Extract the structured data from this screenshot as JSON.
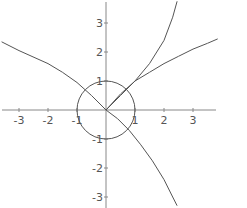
{
  "chart_data": {
    "type": "line",
    "title": "",
    "xlabel": "",
    "ylabel": "",
    "xlim": [
      -3.6,
      3.85
    ],
    "ylim": [
      -3.3,
      3.75
    ],
    "grid": false,
    "legend": null,
    "x_ticks": [
      -3,
      -2,
      -1,
      1,
      2,
      3
    ],
    "y_ticks": [
      -3,
      -2,
      -1,
      1,
      2,
      3
    ],
    "x_tick_labels": [
      "-3",
      "-2",
      "-1",
      "1",
      "2",
      "3"
    ],
    "y_tick_labels": [
      "-3",
      "-2",
      "-1",
      "1",
      "2",
      "3"
    ],
    "series": [
      {
        "name": "unit-circle",
        "shape": "circle",
        "center": [
          0,
          0
        ],
        "radius": 1
      },
      {
        "name": "curve-through-origin",
        "points": [
          [
            -3.6,
            2.35
          ],
          [
            -3,
            2.05
          ],
          [
            -2,
            1.6
          ],
          [
            -1.5,
            1.3
          ],
          [
            -1,
            0.95
          ],
          [
            -0.5,
            0.5
          ],
          [
            0,
            0
          ],
          [
            0.4,
            -0.3
          ],
          [
            0.8,
            -0.7
          ],
          [
            1.2,
            -1.2
          ],
          [
            1.6,
            -1.75
          ],
          [
            2,
            -2.4
          ],
          [
            2.3,
            -3.0
          ],
          [
            2.45,
            -3.3
          ]
        ]
      },
      {
        "name": "steep-branch",
        "points": [
          [
            0,
            0
          ],
          [
            0.5,
            0.5
          ],
          [
            1,
            1
          ],
          [
            1.5,
            1.6
          ],
          [
            2,
            2.4
          ],
          [
            2.3,
            3.2
          ],
          [
            2.45,
            3.75
          ]
        ]
      },
      {
        "name": "shallow-branch",
        "points": [
          [
            0,
            0
          ],
          [
            0.5,
            0.55
          ],
          [
            1,
            1
          ],
          [
            1.5,
            1.3
          ],
          [
            2,
            1.6
          ],
          [
            2.5,
            1.85
          ],
          [
            3,
            2.1
          ],
          [
            3.5,
            2.3
          ],
          [
            3.85,
            2.45
          ]
        ]
      }
    ]
  },
  "axes": {
    "x_labels": [
      "-3",
      "-2",
      "-1",
      "1",
      "2",
      "3"
    ],
    "y_labels": [
      "3",
      "2",
      "1",
      "-1",
      "-2",
      "-3"
    ]
  }
}
